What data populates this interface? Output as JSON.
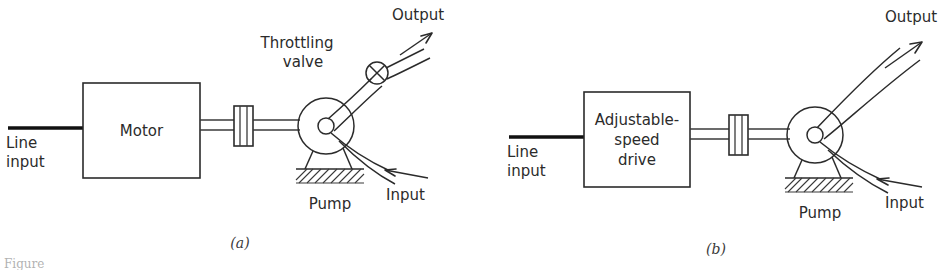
{
  "figure": {
    "caption_fragment": "Figure",
    "panels": [
      {
        "id": "panel-a",
        "sublabel": "(a)",
        "source_label": "Line\ninput",
        "source_label_line1": "Line",
        "source_label_line2": "input",
        "block_label": "Motor",
        "block_label_lines": [
          "Motor"
        ],
        "pump_label": "Pump",
        "valve_label_line1": "Throttling",
        "valve_label_line2": "valve",
        "output_label": "Output",
        "input_label": "Input",
        "has_throttling_valve": true
      },
      {
        "id": "panel-b",
        "sublabel": "(b)",
        "source_label_line1": "Line",
        "source_label_line2": "input",
        "block_label": "Adjustable-speed drive",
        "block_label_lines": [
          "Adjustable-",
          "speed",
          "drive"
        ],
        "pump_label": "Pump",
        "output_label": "Output",
        "input_label": "Input",
        "has_throttling_valve": false
      }
    ]
  },
  "colors": {
    "ink": "#2b2b2b",
    "ink_dark": "#111111",
    "paper": "#ffffff",
    "caption": "#555555"
  }
}
